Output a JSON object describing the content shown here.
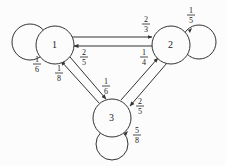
{
  "diagram": {
    "type": "markov-chain",
    "nodes": [
      {
        "id": "1",
        "label": "1",
        "cx": 55,
        "cy": 45
      },
      {
        "id": "2",
        "label": "2",
        "cx": 171,
        "cy": 45
      },
      {
        "id": "3",
        "label": "3",
        "cx": 112,
        "cy": 118
      }
    ],
    "self_loops": [
      {
        "node": "1",
        "num": "1",
        "den": "6"
      },
      {
        "node": "2",
        "num": "1",
        "den": "5"
      },
      {
        "node": "3",
        "num": "5",
        "den": "8"
      }
    ],
    "edges": [
      {
        "from": "1",
        "to": "2",
        "num": "2",
        "den": "3"
      },
      {
        "from": "2",
        "to": "1",
        "num": "2",
        "den": "5"
      },
      {
        "from": "1",
        "to": "3",
        "num": "1",
        "den": "6"
      },
      {
        "from": "3",
        "to": "1",
        "num": "1",
        "den": "8"
      },
      {
        "from": "2",
        "to": "3",
        "num": "2",
        "den": "5"
      },
      {
        "from": "3",
        "to": "2",
        "num": "1",
        "den": "4"
      }
    ]
  }
}
